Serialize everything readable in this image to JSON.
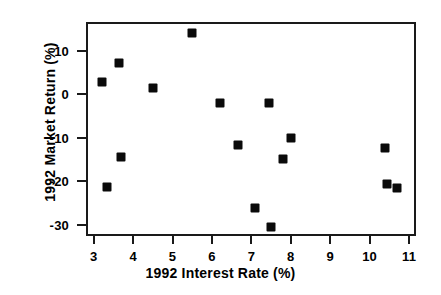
{
  "chart_data": {
    "type": "scatter",
    "title": "",
    "xlabel": "1992 Interest Rate (%)",
    "ylabel": "1992 Market Return (%)",
    "xlim": [
      2.8,
      11.2
    ],
    "ylim": [
      -33.5,
      16.5
    ],
    "xticks": [
      3,
      4,
      5,
      6,
      7,
      8,
      9,
      10,
      11
    ],
    "xtick_labels": [
      "3",
      "4",
      "5",
      "6",
      "7",
      "8",
      "9",
      "10",
      "11"
    ],
    "yticks": [
      10,
      0,
      -10,
      -20,
      -30
    ],
    "ytick_labels": [
      "10",
      "0",
      "-10",
      "-20",
      "-30"
    ],
    "grid": false,
    "legend": null,
    "marker": {
      "shape": "square",
      "color": "#0a0a0a",
      "size_px": 9
    },
    "frame_color": "#1a1a1a",
    "background": "#ffffff",
    "series": [
      {
        "name": "countries",
        "points": [
          {
            "x": 3.2,
            "y": 2.8
          },
          {
            "x": 3.35,
            "y": -21.4
          },
          {
            "x": 3.65,
            "y": 7.3
          },
          {
            "x": 3.7,
            "y": -14.5
          },
          {
            "x": 4.5,
            "y": 1.4
          },
          {
            "x": 5.5,
            "y": 14.1
          },
          {
            "x": 6.2,
            "y": -1.9
          },
          {
            "x": 6.65,
            "y": -11.7
          },
          {
            "x": 7.1,
            "y": -26.2
          },
          {
            "x": 7.45,
            "y": -1.9
          },
          {
            "x": 7.5,
            "y": -30.6
          },
          {
            "x": 7.8,
            "y": -14.9
          },
          {
            "x": 8.0,
            "y": -10.1
          },
          {
            "x": 10.4,
            "y": -12.3
          },
          {
            "x": 10.45,
            "y": -20.7
          },
          {
            "x": 10.7,
            "y": -21.5
          }
        ]
      }
    ]
  }
}
